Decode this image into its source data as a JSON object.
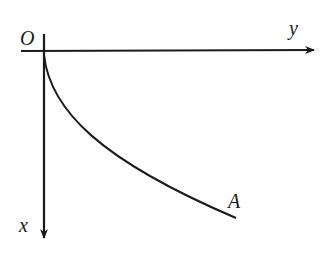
{
  "diagram": {
    "origin_label": "O",
    "horizontal_axis_label": "y",
    "vertical_axis_label": "x",
    "curve_end_label": "A",
    "stroke_color": "#1a1a1a"
  }
}
